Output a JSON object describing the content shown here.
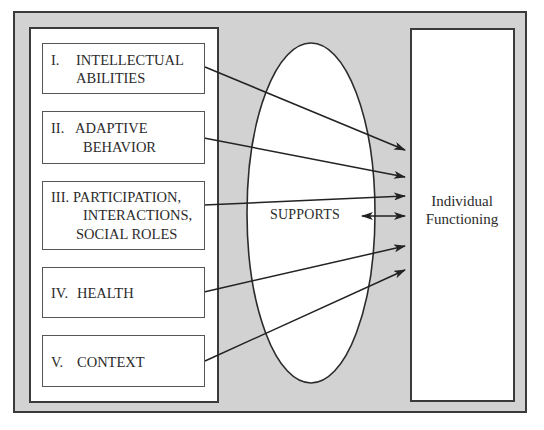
{
  "diagram": {
    "dimensions": [
      {
        "numeral": "I.",
        "lines": [
          "INTELLECTUAL",
          "ABILITIES"
        ]
      },
      {
        "numeral": "II.",
        "lines": [
          "ADAPTIVE",
          "BEHAVIOR"
        ]
      },
      {
        "numeral": "III.",
        "lines": [
          "PARTICIPATION,",
          "INTERACTIONS,",
          "SOCIAL ROLES"
        ]
      },
      {
        "numeral": "IV.",
        "lines": [
          "HEALTH"
        ]
      },
      {
        "numeral": "V.",
        "lines": [
          "CONTEXT"
        ]
      }
    ],
    "mediator": {
      "label": "SUPPORTS",
      "shape": "ellipse"
    },
    "outcome": {
      "lines": [
        "Individual",
        "Functioning"
      ]
    },
    "colors": {
      "frame_background": "#d2d2d2",
      "box_background": "#ffffff",
      "stroke": "#2b2b2b"
    }
  }
}
